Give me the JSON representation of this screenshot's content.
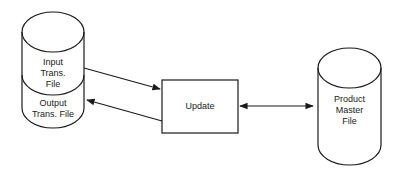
{
  "diagram": {
    "type": "system-flowchart",
    "nodes": [
      {
        "id": "input_trans_file",
        "shape": "cylinder-upper",
        "label": "Input\nTrans.\nFile"
      },
      {
        "id": "output_trans_file",
        "shape": "cylinder-lower",
        "label": "Output\nTrans. File"
      },
      {
        "id": "update",
        "shape": "rectangle",
        "label": "Update"
      },
      {
        "id": "product_master_file",
        "shape": "cylinder",
        "label": "Product\nMaster\nFile"
      }
    ],
    "edges": [
      {
        "from": "input_trans_file",
        "to": "update",
        "direction": "forward"
      },
      {
        "from": "update",
        "to": "output_trans_file",
        "direction": "forward"
      },
      {
        "from": "update",
        "to": "product_master_file",
        "direction": "bidirectional"
      }
    ],
    "colors": {
      "stroke": "#1a1a1a",
      "background": "#ffffff"
    }
  }
}
